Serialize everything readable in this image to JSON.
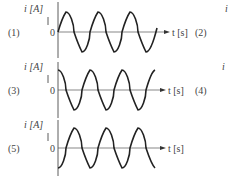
{
  "figure": {
    "y_axis_label": "i [A]",
    "x_axis_label": "t [s]",
    "origin_label": "0",
    "panels": [
      {
        "id": "1",
        "label": "(1)",
        "waveform": "sin",
        "phase_deg": 0
      },
      {
        "id": "2",
        "label": "(2)",
        "waveform": "hidden",
        "partial_y_label": "i"
      },
      {
        "id": "3",
        "label": "(3)",
        "waveform": "cos",
        "phase_deg": 90
      },
      {
        "id": "4",
        "label": "(4)",
        "waveform": "hidden",
        "partial_y_label": "i"
      },
      {
        "id": "5",
        "label": "(5)",
        "waveform": "-cos",
        "phase_deg": -90
      }
    ]
  }
}
